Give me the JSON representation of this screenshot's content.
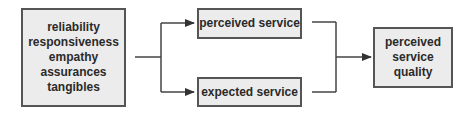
{
  "diagram": {
    "left_box": {
      "lines": [
        "reliability",
        "responsiveness",
        "empathy",
        "assurances",
        "tangibles"
      ]
    },
    "top_box": {
      "label": "perceived service"
    },
    "bottom_box": {
      "label": "expected service"
    },
    "right_box": {
      "lines": [
        "perceived",
        "service",
        "quality"
      ]
    },
    "colors": {
      "box_fill": "#ececec",
      "border": "#555555",
      "line": "#444444",
      "text": "#2a2a2a"
    }
  }
}
